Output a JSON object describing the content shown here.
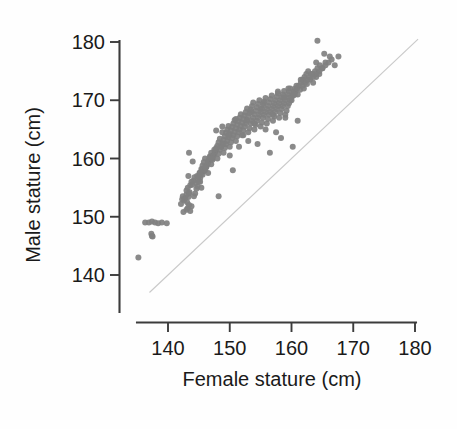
{
  "figure": {
    "background_color": "#fefefe",
    "point_color": "#808080",
    "axis_color": "#3c3c3c",
    "reference_line_color": "#c9c9c9"
  },
  "axes": {
    "y_title": "Male stature (cm)",
    "x_title": "Female stature (cm)",
    "y_ticks": [
      "140",
      "150",
      "160",
      "170",
      "180"
    ],
    "x_ticks": [
      "140",
      "150",
      "160",
      "170",
      "180"
    ]
  },
  "chart_data": {
    "type": "scatter",
    "title": "",
    "xlabel": "Female stature (cm)",
    "ylabel": "Male stature (cm)",
    "xlim": [
      134,
      181
    ],
    "ylim": [
      136.5,
      181
    ],
    "xticks": [
      140,
      150,
      160,
      170,
      180
    ],
    "yticks": [
      140,
      150,
      160,
      170,
      180
    ],
    "grid": false,
    "legend": null,
    "annotations": [],
    "reference_line": {
      "type": "identity",
      "label": "y = x",
      "from": [
        137.0,
        137.0
      ],
      "to": [
        180.5,
        180.5
      ],
      "color": "#c9c9c9"
    },
    "series": [
      {
        "name": "Spousal stature pairs",
        "marker": "circle",
        "marker_size_px": 6,
        "color": "#808080",
        "n": 281,
        "x": [
          135.2,
          136.3,
          136.9,
          137.4,
          137.9,
          138.4,
          139.0,
          139.8,
          137.3,
          137.4,
          137.5,
          142.1,
          142.3,
          142.4,
          142.6,
          142.8,
          143.0,
          143.1,
          143.3,
          143.4,
          143.0,
          143.2,
          143.5,
          143.6,
          143.8,
          143.0,
          143.2,
          143.4,
          143.6,
          143.8,
          143.4,
          143.9,
          144.1,
          144.3,
          144.5,
          144.7,
          144.9,
          145.1,
          145.3,
          145.5,
          144.2,
          144.4,
          144.6,
          144.8,
          145.0,
          145.2,
          145.4,
          145.6,
          145.8,
          146.0,
          145.0,
          145.2,
          145.4,
          145.6,
          145.8,
          146.0,
          146.2,
          146.4,
          146.6,
          146.8,
          146.0,
          146.2,
          146.4,
          146.6,
          146.8,
          147.0,
          147.2,
          147.4,
          147.6,
          147.8,
          147.0,
          147.2,
          147.4,
          147.6,
          147.8,
          148.0,
          148.2,
          148.4,
          148.6,
          148.8,
          148.0,
          148.2,
          148.4,
          148.6,
          148.8,
          149.0,
          149.2,
          149.4,
          149.6,
          149.8,
          149.0,
          149.2,
          149.4,
          149.6,
          149.8,
          150.0,
          150.2,
          150.4,
          150.6,
          150.8,
          150.0,
          150.2,
          150.4,
          150.6,
          150.8,
          151.0,
          151.2,
          151.4,
          151.6,
          151.8,
          151.0,
          151.2,
          151.4,
          151.6,
          151.8,
          152.0,
          152.2,
          152.4,
          152.6,
          152.8,
          152.0,
          152.2,
          152.4,
          152.6,
          152.8,
          153.0,
          153.2,
          153.4,
          153.6,
          153.8,
          153.0,
          153.2,
          153.4,
          153.6,
          153.8,
          154.0,
          154.2,
          154.4,
          154.6,
          154.8,
          154.0,
          154.2,
          154.4,
          154.6,
          154.8,
          155.0,
          155.2,
          155.4,
          155.6,
          155.8,
          155.0,
          155.2,
          155.4,
          155.6,
          155.8,
          156.0,
          156.2,
          156.4,
          156.6,
          156.8,
          156.0,
          156.2,
          156.4,
          156.6,
          156.8,
          157.0,
          157.2,
          157.4,
          157.6,
          157.8,
          157.0,
          157.2,
          157.4,
          157.6,
          157.8,
          158.0,
          158.2,
          158.4,
          158.6,
          158.8,
          158.0,
          158.2,
          158.4,
          158.6,
          158.8,
          159.0,
          159.2,
          159.4,
          159.6,
          159.8,
          159.0,
          159.2,
          159.4,
          159.6,
          159.8,
          160.0,
          160.2,
          160.4,
          160.6,
          160.8,
          160.0,
          160.3,
          160.6,
          160.9,
          161.2,
          161.5,
          161.8,
          162.1,
          162.4,
          162.7,
          161.0,
          161.4,
          161.8,
          162.2,
          162.6,
          163.0,
          163.4,
          163.8,
          164.2,
          164.6,
          162.0,
          162.5,
          163.0,
          163.5,
          164.0,
          164.5,
          165.0,
          165.5,
          166.0,
          166.5,
          163.5,
          164.0,
          164.5,
          165.0,
          165.5,
          166.2,
          167.0,
          167.6,
          164.2,
          165.3,
          143.3,
          146.0,
          147.8,
          148.2,
          151.5,
          153.0,
          154.5,
          156.5,
          158.3,
          160.2,
          145.2,
          147.0,
          149.0,
          150.5,
          152.2,
          154.0,
          155.8,
          157.5,
          159.0,
          161.0,
          144.0,
          146.5,
          148.8,
          150.0,
          152.8,
          155.0,
          157.0,
          158.8,
          160.5,
          162.0,
          147.5,
          149.8,
          151.0,
          153.5,
          155.5,
          157.8,
          159.5,
          161.5,
          163.2,
          164.0,
          142.5
        ],
        "y": [
          143.0,
          149.0,
          149.0,
          149.2,
          149.0,
          148.9,
          149.0,
          148.9,
          147.1,
          146.7,
          146.6,
          152.2,
          153.0,
          153.5,
          152.8,
          153.2,
          153.8,
          152.5,
          153.4,
          154.0,
          154.5,
          155.0,
          154.2,
          155.4,
          156.0,
          151.2,
          151.5,
          152.0,
          151.0,
          151.8,
          161.0,
          155.5,
          156.2,
          156.8,
          155.8,
          157.0,
          156.4,
          157.5,
          157.2,
          158.0,
          153.5,
          154.0,
          154.8,
          155.2,
          156.0,
          156.6,
          155.0,
          157.2,
          157.8,
          158.4,
          157.0,
          157.6,
          158.2,
          158.8,
          159.4,
          160.0,
          158.5,
          159.0,
          159.6,
          160.2,
          158.0,
          158.6,
          159.2,
          159.8,
          160.4,
          161.0,
          160.0,
          160.6,
          161.2,
          161.8,
          159.0,
          159.8,
          160.5,
          161.0,
          161.6,
          162.2,
          162.8,
          163.4,
          162.0,
          164.5,
          160.0,
          160.8,
          161.5,
          162.0,
          162.6,
          163.2,
          163.8,
          164.4,
          165.0,
          165.6,
          161.0,
          161.8,
          162.5,
          163.0,
          163.6,
          164.2,
          164.8,
          165.4,
          166.0,
          166.6,
          162.0,
          162.8,
          163.5,
          164.0,
          164.6,
          165.2,
          165.8,
          166.4,
          167.0,
          167.6,
          163.0,
          163.8,
          164.5,
          165.0,
          165.6,
          166.2,
          166.8,
          167.4,
          168.0,
          168.6,
          164.0,
          164.8,
          165.5,
          166.0,
          166.6,
          167.2,
          167.8,
          168.4,
          169.0,
          169.6,
          164.5,
          165.2,
          166.0,
          166.5,
          167.0,
          167.6,
          168.2,
          168.8,
          169.4,
          170.0,
          165.0,
          165.8,
          166.5,
          167.0,
          167.5,
          168.0,
          168.6,
          169.2,
          169.8,
          170.4,
          165.5,
          166.2,
          167.0,
          167.5,
          168.0,
          168.5,
          169.0,
          169.6,
          170.2,
          170.8,
          166.0,
          166.8,
          167.5,
          168.0,
          168.5,
          169.0,
          169.5,
          170.0,
          170.6,
          171.2,
          166.5,
          167.2,
          168.0,
          168.5,
          169.0,
          169.5,
          170.0,
          170.5,
          171.0,
          171.6,
          167.0,
          167.8,
          168.5,
          169.0,
          169.5,
          170.0,
          170.5,
          171.0,
          171.5,
          172.0,
          167.5,
          168.2,
          169.0,
          169.5,
          170.0,
          170.5,
          171.0,
          171.5,
          172.0,
          172.5,
          170.0,
          170.8,
          171.5,
          172.0,
          172.5,
          173.0,
          173.5,
          174.0,
          174.5,
          175.0,
          171.0,
          171.8,
          172.5,
          173.0,
          173.5,
          174.0,
          174.5,
          175.0,
          175.5,
          176.0,
          172.0,
          172.8,
          173.5,
          174.0,
          174.5,
          175.0,
          175.5,
          176.0,
          176.5,
          177.0,
          173.0,
          174.0,
          174.5,
          175.5,
          176.5,
          177.5,
          176.0,
          177.5,
          180.2,
          178.0,
          157.0,
          158.5,
          164.8,
          153.5,
          162.0,
          163.0,
          162.5,
          161.0,
          163.5,
          162.0,
          156.0,
          160.0,
          162.5,
          158.0,
          164.0,
          166.0,
          165.0,
          164.5,
          167.0,
          166.5,
          159.5,
          157.5,
          165.5,
          160.5,
          166.5,
          168.5,
          167.5,
          170.5,
          171.0,
          173.5,
          161.5,
          164.0,
          166.8,
          168.0,
          169.5,
          171.5,
          172.0,
          173.5,
          174.5,
          176.5,
          150.8
        ]
      }
    ]
  }
}
